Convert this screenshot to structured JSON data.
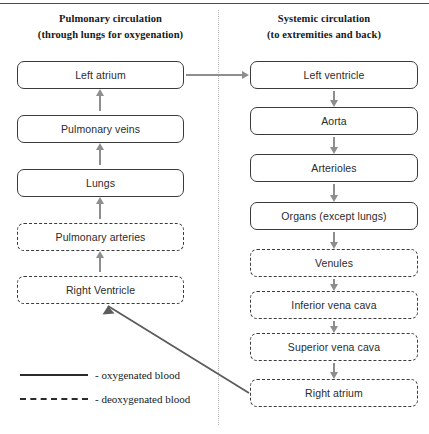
{
  "diagram": {
    "title_left_line1": "Pulmonary circulation",
    "title_left_line2": "(through lungs for oxygenation)",
    "title_right_line1": "Systemic circulation",
    "title_right_line2": "(to extremities and back)",
    "pulmonary_nodes": [
      {
        "label": "Left atrium",
        "blood": "oxygenated",
        "style": "solid"
      },
      {
        "label": "Pulmonary veins",
        "blood": "oxygenated",
        "style": "solid"
      },
      {
        "label": "Lungs",
        "blood": "oxygenated",
        "style": "solid"
      },
      {
        "label": "Pulmonary arteries",
        "blood": "deoxygenated",
        "style": "dashed"
      },
      {
        "label": "Right Ventricle",
        "blood": "deoxygenated",
        "style": "dashed"
      }
    ],
    "systemic_nodes": [
      {
        "label": "Left ventricle",
        "blood": "oxygenated",
        "style": "solid"
      },
      {
        "label": "Aorta",
        "blood": "oxygenated",
        "style": "solid"
      },
      {
        "label": "Arterioles",
        "blood": "oxygenated",
        "style": "solid"
      },
      {
        "label": "Organs (except lungs)",
        "blood": "oxygenated",
        "style": "solid"
      },
      {
        "label": "Venules",
        "blood": "deoxygenated",
        "style": "dashed"
      },
      {
        "label": "Inferior vena cava",
        "blood": "deoxygenated",
        "style": "dashed"
      },
      {
        "label": "Superior vena cava",
        "blood": "deoxygenated",
        "style": "dashed"
      },
      {
        "label": "Right atrium",
        "blood": "deoxygenated",
        "style": "dashed"
      }
    ]
  },
  "legend": {
    "items": [
      {
        "style": "solid",
        "label": "- oxygenated blood"
      },
      {
        "style": "dashed",
        "label": "- deoxygenated blood"
      }
    ]
  },
  "colors": {
    "box_border": "#3b3b3b",
    "arrow": "#8e8e8e",
    "text": "#2b2b2b",
    "heading_text": "#15181c",
    "divider": "#b9b9b9",
    "connector": "#5c5c5c"
  }
}
